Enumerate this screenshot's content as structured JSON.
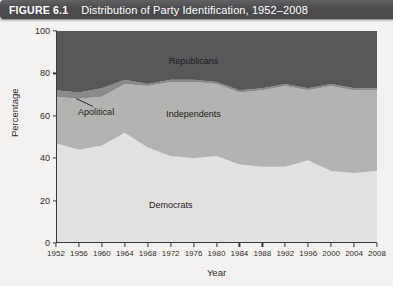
{
  "figure": {
    "number": "FIGURE 6.1",
    "title": "Distribution of Party Identification, 1952–2008"
  },
  "chart_data": {
    "type": "area",
    "stacked": true,
    "title": "Distribution of Party Identification, 1952–2008",
    "xlabel": "Year",
    "ylabel": "Percentage",
    "xlim": [
      1952,
      2008
    ],
    "ylim": [
      0,
      100
    ],
    "grid": false,
    "legend_position": "inside-plot-labels",
    "x_tick_labels": [
      "1952",
      "1956",
      "1960",
      "1964",
      "1968",
      "1972",
      "1976",
      "1980",
      "1984",
      "1988",
      "1992",
      "1996",
      "2000",
      "2004",
      "2008"
    ],
    "y_tick_labels": [
      "0",
      "20",
      "40",
      "60",
      "80",
      "100"
    ],
    "y_ticks": [
      0,
      20,
      40,
      60,
      80,
      100
    ],
    "categories": [
      1952,
      1956,
      1960,
      1964,
      1968,
      1972,
      1976,
      1980,
      1984,
      1988,
      1992,
      1996,
      2000,
      2004,
      2008
    ],
    "series": [
      {
        "name": "Democrats",
        "color": "#e3e2e0",
        "values": [
          47,
          44,
          46,
          52,
          45,
          41,
          40,
          41,
          37,
          36,
          36,
          39,
          34,
          33,
          34
        ]
      },
      {
        "name": "Independents",
        "color": "#b3b3b1",
        "values": [
          22,
          24,
          23,
          23,
          29,
          35,
          36,
          34,
          34,
          36,
          38,
          33,
          40,
          39,
          38
        ]
      },
      {
        "name": "Apolitical",
        "color": "#8a8a88",
        "values": [
          3,
          3,
          4,
          2,
          1,
          1,
          1,
          1,
          1,
          1,
          1,
          1,
          1,
          1,
          1
        ]
      },
      {
        "name": "Republicans",
        "color": "#57575a",
        "values": [
          28,
          29,
          27,
          23,
          25,
          23,
          23,
          24,
          28,
          27,
          25,
          27,
          25,
          27,
          27
        ]
      }
    ],
    "annotations": [
      {
        "text": "Republicans",
        "x": 1976,
        "y": 86
      },
      {
        "text": "Independents",
        "x": 1976,
        "y": 61
      },
      {
        "text": "Democrats",
        "x": 1972,
        "y": 18
      },
      {
        "text": "Apolitical",
        "x": 1959,
        "y": 62,
        "leader": true
      }
    ]
  }
}
